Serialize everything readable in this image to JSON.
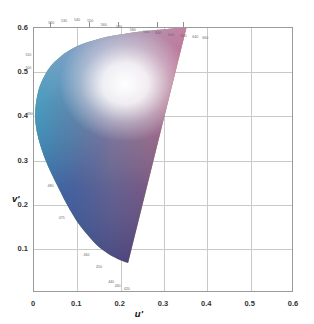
{
  "chart_data": {
    "type": "scatter",
    "title": "",
    "subtitle": "",
    "xlabel": "u'",
    "ylabel": "v'",
    "xlim": [
      0,
      0.6
    ],
    "ylim": [
      0,
      0.6
    ],
    "grid": true,
    "legend_position": "none",
    "xticks": [
      "0",
      "0.1",
      "0.2",
      "0.3",
      "0.4",
      "0.5",
      "0.6"
    ],
    "xtick_values": [
      0,
      0.1,
      0.2,
      0.3,
      0.4,
      0.5,
      0.6
    ],
    "yticks": [
      "0.1",
      "0.2",
      "0.3",
      "0.4",
      "0.5",
      "0.6"
    ],
    "ytick_values": [
      0.1,
      0.2,
      0.3,
      0.4,
      0.5,
      0.6
    ],
    "white_point": {
      "u": 0.2105,
      "v": 0.4737
    },
    "spectral_locus": [
      {
        "wavelength": 420,
        "u": 0.2171,
        "v": 0.0677
      },
      {
        "wavelength": 430,
        "u": 0.2011,
        "v": 0.0734
      },
      {
        "wavelength": 440,
        "u": 0.1842,
        "v": 0.0813
      },
      {
        "wavelength": 450,
        "u": 0.1638,
        "v": 0.0939
      },
      {
        "wavelength": 460,
        "u": 0.1383,
        "v": 0.1151
      },
      {
        "wavelength": 470,
        "u": 0.1051,
        "v": 0.1538
      },
      {
        "wavelength": 475,
        "u": 0.0853,
        "v": 0.1844
      },
      {
        "wavelength": 480,
        "u": 0.0633,
        "v": 0.2247
      },
      {
        "wavelength": 490,
        "u": 0.0235,
        "v": 0.3087
      },
      {
        "wavelength": 500,
        "u": 0.0034,
        "v": 0.3857
      },
      {
        "wavelength": 510,
        "u": 0.0092,
        "v": 0.4546
      },
      {
        "wavelength": 520,
        "u": 0.0327,
        "v": 0.5059
      },
      {
        "wavelength": 530,
        "u": 0.061,
        "v": 0.5351
      },
      {
        "wavelength": 540,
        "u": 0.0903,
        "v": 0.5539
      },
      {
        "wavelength": 550,
        "u": 0.1212,
        "v": 0.5669
      },
      {
        "wavelength": 560,
        "u": 0.1528,
        "v": 0.5762
      },
      {
        "wavelength": 570,
        "u": 0.184,
        "v": 0.5829
      },
      {
        "wavelength": 580,
        "u": 0.2137,
        "v": 0.5877
      },
      {
        "wavelength": 590,
        "u": 0.2415,
        "v": 0.5913
      },
      {
        "wavelength": 600,
        "u": 0.2658,
        "v": 0.594
      },
      {
        "wavelength": 610,
        "u": 0.2858,
        "v": 0.5959
      },
      {
        "wavelength": 620,
        "u": 0.3021,
        "v": 0.5974
      },
      {
        "wavelength": 640,
        "u": 0.3257,
        "v": 0.5994
      },
      {
        "wavelength": 700,
        "u": 0.352,
        "v": 0.6014
      }
    ],
    "annotations": [
      {
        "label": "520",
        "u": 0.04,
        "v": 0.612
      },
      {
        "label": "530",
        "u": 0.069,
        "v": 0.616
      },
      {
        "label": "540",
        "u": 0.099,
        "v": 0.618
      },
      {
        "label": "550",
        "u": 0.13,
        "v": 0.616
      },
      {
        "label": "560",
        "u": 0.161,
        "v": 0.606
      },
      {
        "label": "570",
        "u": 0.196,
        "v": 0.602
      },
      {
        "label": "580",
        "u": 0.228,
        "v": 0.596
      },
      {
        "label": "590",
        "u": 0.259,
        "v": 0.592
      },
      {
        "label": "600",
        "u": 0.287,
        "v": 0.588
      },
      {
        "label": "610",
        "u": 0.316,
        "v": 0.585
      },
      {
        "label": "620",
        "u": 0.345,
        "v": 0.582
      },
      {
        "label": "640",
        "u": 0.372,
        "v": 0.58
      },
      {
        "label": "660",
        "u": 0.395,
        "v": 0.578
      },
      {
        "label": "510",
        "u": -0.013,
        "v": 0.54
      },
      {
        "label": "500",
        "u": -0.013,
        "v": 0.51
      },
      {
        "label": "490",
        "u": -0.01,
        "v": 0.405
      },
      {
        "label": "480",
        "u": 0.038,
        "v": 0.243
      },
      {
        "label": "475",
        "u": 0.064,
        "v": 0.17
      },
      {
        "label": "460",
        "u": 0.121,
        "v": 0.086
      },
      {
        "label": "450",
        "u": 0.15,
        "v": 0.058
      },
      {
        "label": "440",
        "u": 0.178,
        "v": 0.026
      },
      {
        "label": "430",
        "u": 0.193,
        "v": 0.015
      },
      {
        "label": "420",
        "u": 0.214,
        "v": 0.008
      }
    ],
    "colors": {
      "frame": "#9a9a9a",
      "grid": "#c9c9c9",
      "tick_text": "#333333",
      "annotation_text": "#6a6a6a",
      "background": "#ffffff",
      "green": "#5fbf3f",
      "yellow": "#f0e840",
      "orange": "#f57c20",
      "red": "#ec1c24",
      "magenta": "#c2268f",
      "violet": "#3b2f82",
      "blue": "#2a5cc8",
      "cyan": "#2ec3d8",
      "white_center": "#ffffff"
    }
  },
  "axis": {
    "x_label": "u'",
    "y_label": "v'"
  }
}
